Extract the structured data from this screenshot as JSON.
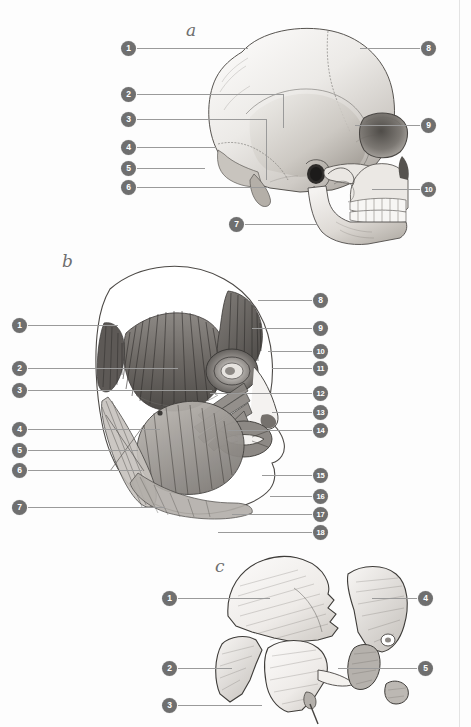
{
  "page": {
    "background_color": "#fdfdfd",
    "marker_color": "#6f6f6f",
    "marker_text_color": "#ffffff",
    "leader_color": "#9a9a9a",
    "rule_color": "#e3e3e3",
    "width": 471,
    "height": 727
  },
  "panels": [
    {
      "id": "panel-a",
      "letter": "a",
      "letter_x": 186,
      "letter_y": 20,
      "subject": "lateral-skull-illustration",
      "left_markers": [
        {
          "n": "1",
          "x": 121,
          "y": 41,
          "line_to_x": 248,
          "line_y": 48
        },
        {
          "n": "2",
          "x": 121,
          "y": 87,
          "line_to_x": 283,
          "line_y": 94,
          "elbow_y": 128
        },
        {
          "n": "3",
          "x": 121,
          "y": 112,
          "line_to_x": 266,
          "line_y": 119,
          "elbow_y": 180
        },
        {
          "n": "4",
          "x": 121,
          "y": 140,
          "line_to_x": 216,
          "line_y": 147
        },
        {
          "n": "5",
          "x": 121,
          "y": 161,
          "line_to_x": 205,
          "line_y": 168
        },
        {
          "n": "6",
          "x": 121,
          "y": 180,
          "line_to_x": 268,
          "line_y": 187
        },
        {
          "n": "7",
          "x": 229,
          "y": 217,
          "line_to_x": 318,
          "line_y": 224
        }
      ],
      "right_markers": [
        {
          "n": "8",
          "x": 421,
          "y": 41,
          "line_to_x": 360,
          "line_y": 48
        },
        {
          "n": "9",
          "x": 421,
          "y": 118,
          "line_to_x": 355,
          "line_y": 125
        },
        {
          "n": "10",
          "x": 421,
          "y": 182,
          "line_to_x": 372,
          "line_y": 189
        }
      ]
    },
    {
      "id": "panel-b",
      "letter": "b",
      "letter_x": 62,
      "letter_y": 251,
      "subject": "facial-muscles-illustration",
      "left_markers": [
        {
          "n": "1",
          "x": 12,
          "y": 318,
          "line_to_x": 118,
          "line_y": 325
        },
        {
          "n": "2",
          "x": 12,
          "y": 361,
          "line_to_x": 178,
          "line_y": 368
        },
        {
          "n": "3",
          "x": 12,
          "y": 383,
          "line_to_x": 212,
          "line_y": 390
        },
        {
          "n": "4",
          "x": 12,
          "y": 422,
          "line_to_x": 160,
          "line_y": 429
        },
        {
          "n": "5",
          "x": 12,
          "y": 443,
          "line_to_x": 138,
          "line_y": 450
        },
        {
          "n": "6",
          "x": 12,
          "y": 463,
          "line_to_x": 142,
          "line_y": 470
        },
        {
          "n": "7",
          "x": 12,
          "y": 500,
          "line_to_x": 165,
          "line_y": 507
        }
      ],
      "right_markers": [
        {
          "n": "8",
          "x": 313,
          "y": 293,
          "line_to_x": 258,
          "line_y": 300
        },
        {
          "n": "9",
          "x": 313,
          "y": 321,
          "line_to_x": 252,
          "line_y": 328
        },
        {
          "n": "10",
          "x": 313,
          "y": 344,
          "line_to_x": 268,
          "line_y": 351
        },
        {
          "n": "11",
          "x": 313,
          "y": 361,
          "line_to_x": 272,
          "line_y": 368
        },
        {
          "n": "12",
          "x": 313,
          "y": 386,
          "line_to_x": 210,
          "line_y": 393
        },
        {
          "n": "13",
          "x": 313,
          "y": 405,
          "line_to_x": 272,
          "line_y": 412
        },
        {
          "n": "14",
          "x": 313,
          "y": 423,
          "line_to_x": 228,
          "line_y": 430
        },
        {
          "n": "15",
          "x": 313,
          "y": 468,
          "line_to_x": 262,
          "line_y": 475
        },
        {
          "n": "16",
          "x": 313,
          "y": 489,
          "line_to_x": 270,
          "line_y": 496
        },
        {
          "n": "17",
          "x": 313,
          "y": 507,
          "line_to_x": 232,
          "line_y": 514
        },
        {
          "n": "18",
          "x": 313,
          "y": 525,
          "line_to_x": 218,
          "line_y": 532
        }
      ]
    },
    {
      "id": "panel-c",
      "letter": "c",
      "letter_x": 215,
      "letter_y": 556,
      "subject": "disarticulated-skull-bones-illustration",
      "left_markers": [
        {
          "n": "1",
          "x": 162,
          "y": 591,
          "line_to_x": 270,
          "line_y": 598
        },
        {
          "n": "2",
          "x": 162,
          "y": 661,
          "line_to_x": 232,
          "line_y": 668
        },
        {
          "n": "3",
          "x": 162,
          "y": 698,
          "line_to_x": 262,
          "line_y": 705
        }
      ],
      "right_markers": [
        {
          "n": "4",
          "x": 418,
          "y": 591,
          "line_to_x": 372,
          "line_y": 598
        },
        {
          "n": "5",
          "x": 418,
          "y": 661,
          "line_to_x": 338,
          "line_y": 668
        }
      ]
    }
  ]
}
